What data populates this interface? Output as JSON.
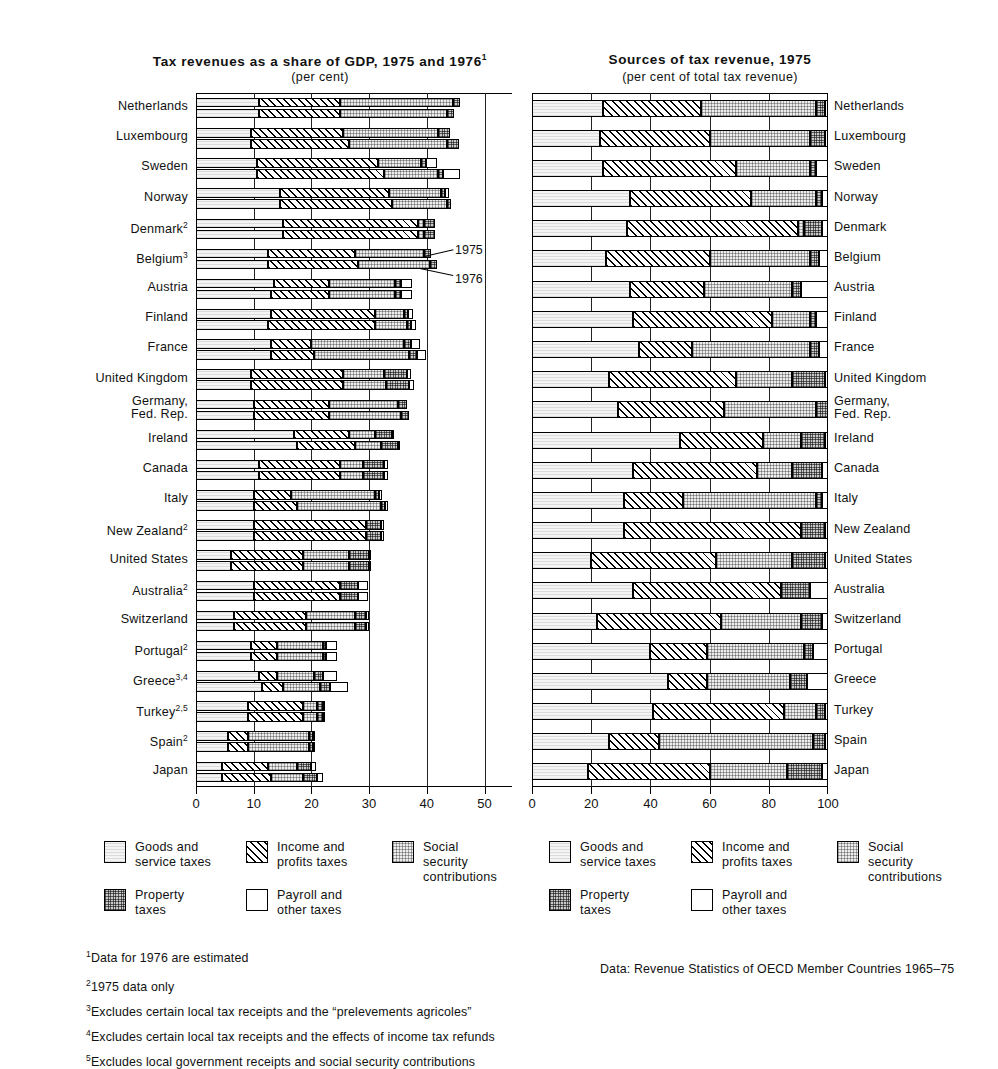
{
  "left": {
    "title": "Tax revenues as a share of GDP, 1975 and 1976",
    "title_sup": "1",
    "subtitle": "(per cent)",
    "annotation_1975": "1975",
    "annotation_1976": "1976",
    "ticks": [
      "0",
      "10",
      "20",
      "30",
      "40",
      "50"
    ]
  },
  "right": {
    "title": "Sources of tax revenue, 1975",
    "subtitle": "(per cent of total tax revenue)",
    "ticks": [
      "0",
      "20",
      "40",
      "60",
      "80",
      "100"
    ]
  },
  "legend": {
    "items": [
      {
        "key": "goods",
        "label": "Goods and\nservice taxes"
      },
      {
        "key": "income",
        "label": "Income and\nprofits taxes"
      },
      {
        "key": "social",
        "label": "Social security\ncontributions"
      },
      {
        "key": "property",
        "label": "Property\ntaxes"
      },
      {
        "key": "payroll",
        "label": "Payroll and\nother taxes"
      }
    ]
  },
  "notes": [
    {
      "sup": "1",
      "text": "Data for 1976 are estimated"
    },
    {
      "sup": "2",
      "text": "1975 data only"
    },
    {
      "sup": "3",
      "text": "Excludes certain local tax receipts and the “prelevements agricoles”"
    },
    {
      "sup": "4",
      "text": "Excludes certain local tax receipts and the effects of income tax refunds"
    },
    {
      "sup": "5",
      "text": "Excludes local government receipts and social security contributions"
    }
  ],
  "source": "Data:   Revenue Statistics of OECD Member Countries 1965–75",
  "chart_data": [
    {
      "type": "bar",
      "orientation": "horizontal",
      "stacked": true,
      "title": "Tax revenues as a share of GDP, 1975 and 1976",
      "subtitle": "(per cent)",
      "xlabel": "",
      "ylabel": "",
      "xlim": [
        0,
        52
      ],
      "xticks": [
        0,
        10,
        20,
        30,
        40,
        50
      ],
      "grid": true,
      "legend_position": "below",
      "series": [
        "goods",
        "income",
        "social",
        "property",
        "payroll"
      ],
      "series_labels": [
        "Goods and service taxes",
        "Income and profits taxes",
        "Social security contributions",
        "Property taxes",
        "Payroll and other taxes"
      ],
      "years": [
        "1975",
        "1976"
      ],
      "categories": [
        {
          "name": "Netherlands",
          "sup": "",
          "v1975": [
            11.0,
            14.0,
            19.5,
            1.2,
            0.0
          ],
          "v1976": [
            11.0,
            14.0,
            18.5,
            1.2,
            0.0
          ]
        },
        {
          "name": "Luxembourg",
          "sup": "",
          "v1975": [
            9.5,
            16.0,
            16.5,
            2.0,
            0.0
          ],
          "v1976": [
            9.5,
            17.0,
            17.0,
            2.0,
            0.0
          ]
        },
        {
          "name": "Sweden",
          "sup": "",
          "v1975": [
            10.5,
            21.0,
            7.5,
            0.8,
            2.0
          ],
          "v1976": [
            10.5,
            22.0,
            9.5,
            0.8,
            3.0
          ]
        },
        {
          "name": "Norway",
          "sup": "",
          "v1975": [
            14.5,
            19.0,
            9.0,
            0.7,
            0.6
          ],
          "v1976": [
            14.5,
            19.5,
            9.5,
            0.7,
            0.0
          ]
        },
        {
          "name": "Denmark",
          "sup": "2",
          "v1975": [
            15.0,
            23.5,
            1.0,
            2.0,
            0.0
          ],
          "v1976": [
            15.0,
            23.5,
            1.0,
            2.0,
            0.0
          ]
        },
        {
          "name": "Belgium",
          "sup": "3",
          "v1975": [
            12.5,
            15.0,
            12.0,
            1.3,
            0.0
          ],
          "v1976": [
            12.5,
            15.5,
            12.5,
            1.3,
            0.0
          ]
        },
        {
          "name": "Austria",
          "sup": "",
          "v1975": [
            13.5,
            9.5,
            11.5,
            1.0,
            2.0
          ],
          "v1976": [
            13.0,
            10.0,
            11.5,
            1.0,
            2.0
          ]
        },
        {
          "name": "Finland",
          "sup": "",
          "v1975": [
            13.0,
            18.0,
            5.0,
            0.8,
            0.8
          ],
          "v1976": [
            12.5,
            18.5,
            5.5,
            0.8,
            0.8
          ]
        },
        {
          "name": "France",
          "sup": "",
          "v1975": [
            13.0,
            7.0,
            16.0,
            1.3,
            1.5
          ],
          "v1976": [
            13.0,
            7.5,
            16.5,
            1.3,
            1.5
          ]
        },
        {
          "name": "United Kingdom",
          "sup": "",
          "v1975": [
            9.5,
            16.0,
            7.0,
            4.0,
            0.7
          ],
          "v1976": [
            9.5,
            16.0,
            7.5,
            4.0,
            0.7
          ]
        },
        {
          "name": "Germany, Fed. Rep.",
          "sup": "",
          "v1975": [
            10.0,
            13.0,
            12.0,
            1.5,
            0.0
          ],
          "v1976": [
            10.0,
            13.0,
            12.5,
            1.5,
            0.0
          ]
        },
        {
          "name": "Ireland",
          "sup": "",
          "v1975": [
            17.0,
            9.5,
            4.5,
            3.0,
            0.4
          ],
          "v1976": [
            17.5,
            10.0,
            4.5,
            3.0,
            0.4
          ]
        },
        {
          "name": "Canada",
          "sup": "",
          "v1975": [
            11.0,
            14.0,
            4.0,
            3.5,
            0.7
          ],
          "v1976": [
            11.0,
            14.0,
            4.0,
            3.5,
            0.7
          ]
        },
        {
          "name": "Italy",
          "sup": "",
          "v1975": [
            10.0,
            6.5,
            14.5,
            0.8,
            0.5
          ],
          "v1976": [
            10.0,
            7.5,
            14.5,
            0.8,
            0.5
          ]
        },
        {
          "name": "New Zealand",
          "sup": "2",
          "v1975": [
            10.0,
            19.5,
            0.0,
            2.5,
            0.5
          ],
          "v1976": [
            10.0,
            19.5,
            0.0,
            2.5,
            0.5
          ]
        },
        {
          "name": "United States",
          "sup": "",
          "v1975": [
            6.0,
            12.5,
            8.0,
            3.5,
            0.2
          ],
          "v1976": [
            6.0,
            12.5,
            8.0,
            3.5,
            0.2
          ]
        },
        {
          "name": "Australia",
          "sup": "2",
          "v1975": [
            10.0,
            15.0,
            0.0,
            3.0,
            1.8
          ],
          "v1976": [
            10.0,
            15.0,
            0.0,
            3.0,
            1.8
          ]
        },
        {
          "name": "Switzerland",
          "sup": "",
          "v1975": [
            6.5,
            12.5,
            8.5,
            2.0,
            0.4
          ],
          "v1976": [
            6.5,
            12.5,
            8.5,
            2.0,
            0.4
          ]
        },
        {
          "name": "Portugal",
          "sup": "2",
          "v1975": [
            9.5,
            4.5,
            8.0,
            0.6,
            1.8
          ],
          "v1976": [
            9.5,
            4.5,
            8.0,
            0.6,
            1.8
          ]
        },
        {
          "name": "Greece",
          "sup": "3,4",
          "v1975": [
            11.0,
            3.0,
            6.5,
            1.5,
            2.5
          ],
          "v1976": [
            11.5,
            3.5,
            6.5,
            1.8,
            3.0
          ]
        },
        {
          "name": "Turkey",
          "sup": "2,5",
          "v1975": [
            9.0,
            9.5,
            2.5,
            1.0,
            0.3
          ],
          "v1976": [
            9.0,
            9.5,
            2.5,
            1.0,
            0.3
          ]
        },
        {
          "name": "Spain",
          "sup": "2",
          "v1975": [
            5.5,
            3.5,
            10.5,
            0.8,
            0.3
          ],
          "v1976": [
            5.5,
            3.5,
            10.5,
            0.8,
            0.3
          ]
        },
        {
          "name": "Japan",
          "sup": "",
          "v1975": [
            4.5,
            8.0,
            5.0,
            2.5,
            0.8
          ],
          "v1976": [
            4.5,
            8.5,
            5.5,
            2.5,
            1.0
          ]
        }
      ]
    },
    {
      "type": "bar",
      "orientation": "horizontal",
      "stacked": true,
      "title": "Sources of tax revenue, 1975",
      "subtitle": "(per cent of total tax revenue)",
      "xlabel": "",
      "ylabel": "",
      "xlim": [
        0,
        100
      ],
      "xticks": [
        0,
        20,
        40,
        60,
        80,
        100
      ],
      "grid": true,
      "legend_position": "below",
      "series": [
        "goods",
        "income",
        "social",
        "property",
        "payroll"
      ],
      "series_labels": [
        "Goods and service taxes",
        "Income and profits taxes",
        "Social security contributions",
        "Property taxes",
        "Payroll and other taxes"
      ],
      "categories": [
        {
          "name": "Netherlands",
          "values": [
            24.0,
            33.0,
            39.0,
            3.0,
            1.0
          ]
        },
        {
          "name": "Luxembourg",
          "values": [
            23.0,
            37.0,
            34.0,
            5.0,
            1.0
          ]
        },
        {
          "name": "Sweden",
          "values": [
            24.0,
            45.0,
            25.0,
            2.0,
            4.0
          ]
        },
        {
          "name": "Norway",
          "values": [
            33.0,
            41.0,
            22.0,
            2.0,
            2.0
          ]
        },
        {
          "name": "Denmark",
          "values": [
            32.0,
            58.0,
            2.0,
            6.0,
            2.0
          ]
        },
        {
          "name": "Belgium",
          "values": [
            25.0,
            35.0,
            34.0,
            3.0,
            3.0
          ]
        },
        {
          "name": "Austria",
          "values": [
            33.0,
            25.0,
            30.0,
            3.0,
            9.0
          ]
        },
        {
          "name": "Finland",
          "values": [
            34.0,
            47.0,
            13.0,
            2.0,
            4.0
          ]
        },
        {
          "name": "France",
          "values": [
            36.0,
            18.0,
            40.0,
            3.0,
            3.0
          ]
        },
        {
          "name": "United Kingdom",
          "values": [
            26.0,
            43.0,
            19.0,
            11.0,
            1.0
          ]
        },
        {
          "name": "Germany, Fed. Rep.",
          "values": [
            29.0,
            36.0,
            31.0,
            4.0,
            0.0
          ]
        },
        {
          "name": "Ireland",
          "values": [
            50.0,
            28.0,
            13.0,
            8.0,
            1.0
          ]
        },
        {
          "name": "Canada",
          "values": [
            34.0,
            42.0,
            12.0,
            10.0,
            2.0
          ]
        },
        {
          "name": "Italy",
          "values": [
            31.0,
            20.0,
            45.0,
            2.0,
            2.0
          ]
        },
        {
          "name": "New Zealand",
          "values": [
            31.0,
            60.0,
            0.0,
            8.0,
            1.0
          ]
        },
        {
          "name": "United States",
          "values": [
            20.0,
            42.0,
            26.0,
            11.0,
            1.0
          ]
        },
        {
          "name": "Australia",
          "values": [
            34.0,
            50.0,
            0.0,
            10.0,
            6.0
          ]
        },
        {
          "name": "Switzerland",
          "values": [
            22.0,
            42.0,
            27.0,
            7.0,
            2.0
          ]
        },
        {
          "name": "Portugal",
          "values": [
            40.0,
            19.0,
            33.0,
            3.0,
            5.0
          ]
        },
        {
          "name": "Greece",
          "values": [
            46.0,
            13.0,
            28.0,
            6.0,
            7.0
          ]
        },
        {
          "name": "Turkey",
          "values": [
            41.0,
            44.0,
            11.0,
            3.0,
            1.0
          ]
        },
        {
          "name": "Spain",
          "values": [
            26.0,
            17.0,
            52.0,
            4.0,
            1.0
          ]
        },
        {
          "name": "Japan",
          "values": [
            19.0,
            41.0,
            26.0,
            12.0,
            2.0
          ]
        }
      ]
    }
  ]
}
